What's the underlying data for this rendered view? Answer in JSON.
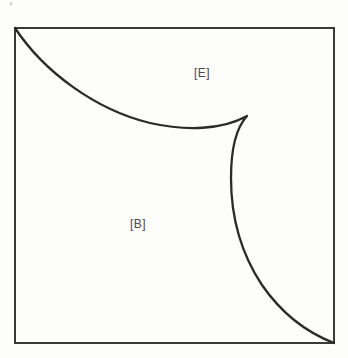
{
  "figure": {
    "type": "region-diagram",
    "background_color": "#fdfdfc",
    "border_color": "#3a3a3a",
    "curve_color": "#2b2b2b",
    "label_color": "#4a4a4a",
    "frame": {
      "x": 15,
      "y": 28,
      "width": 319,
      "height": 315
    },
    "labels": [
      {
        "id": "E",
        "text": "[E]",
        "x": 194,
        "y": 66
      },
      {
        "id": "B",
        "text": "[B]",
        "x": 130,
        "y": 217
      }
    ],
    "curve": {
      "name": "cusp-boundary-curve",
      "description": "Concave arc from top-left corner to a cusp, then convex arc down to bottom-right corner",
      "start_point": [
        15,
        28
      ],
      "cusp_point": [
        247,
        116
      ],
      "end_point": [
        334,
        343
      ],
      "upper_arc_minimum": [
        175,
        127
      ],
      "lower_arc_leftmost": [
        231,
        175
      ],
      "path": "M 15 28 C 44 72, 96 110, 150 123 C 186 131, 222 130, 247 116 C 235 129, 231 152, 231 178 C 231 214, 240 252, 262 285 C 282 314, 308 333, 334 343"
    },
    "speck": {
      "x": 10,
      "y": 2,
      "width": 2,
      "height": 3
    }
  },
  "chart_data": {
    "type": "line",
    "title": "",
    "xlabel": "",
    "ylabel": "",
    "grid": false,
    "legend": "none",
    "annotations": [
      {
        "label": "[E]",
        "region": "upper-right",
        "x": 194,
        "y": 66
      },
      {
        "label": "[B]",
        "region": "lower-left",
        "x": 130,
        "y": 217
      }
    ],
    "series": [
      {
        "name": "cusp-boundary-curve",
        "x": [
          15,
          44,
          75,
          105,
          135,
          160,
          185,
          210,
          232,
          247,
          238,
          233,
          231,
          232,
          236,
          244,
          256,
          272,
          292,
          312,
          334
        ],
        "y": [
          28,
          70,
          93,
          108,
          119,
          124,
          127,
          126,
          122,
          116,
          127,
          142,
          163,
          186,
          210,
          236,
          262,
          287,
          310,
          328,
          343
        ]
      }
    ],
    "xlim": [
      15,
      334
    ],
    "ylim": [
      28,
      343
    ]
  }
}
